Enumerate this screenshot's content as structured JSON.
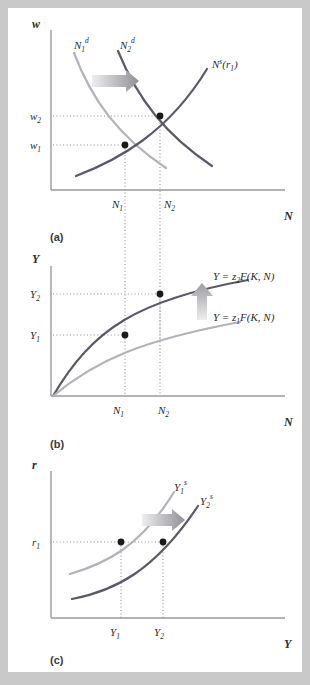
{
  "figure": {
    "background_color": "#c9c9c9",
    "panel_color": "#ffffff",
    "curve_dark_color": "#5a5a66",
    "curve_light_color": "#b2b2b8",
    "axis_color": "#9a9a9a",
    "point_color": "#1a1a1a"
  },
  "panel_a": {
    "id": "(a)",
    "y_axis_label": "w",
    "x_axis_label": "N",
    "y_ticks": [
      "w",
      "w"
    ],
    "y_tick_labels": [
      {
        "base": "w",
        "sub": "2"
      },
      {
        "base": "w",
        "sub": "1"
      }
    ],
    "x_tick_labels": [
      {
        "base": "N",
        "sub": "1"
      },
      {
        "base": "N",
        "sub": "2"
      }
    ],
    "curves": [
      {
        "name": "labor-demand-1",
        "base": "N",
        "sub": "1",
        "sup": "d",
        "color": "#b2b2b8",
        "shape": "downward"
      },
      {
        "name": "labor-demand-2",
        "base": "N",
        "sub": "2",
        "sup": "d",
        "color": "#5a5a66",
        "shape": "downward"
      },
      {
        "name": "labor-supply",
        "base": "N",
        "sup": "s",
        "suffix": "(r",
        "suffix_sub": "1",
        "suffix_end": ")",
        "color": "#5a5a66",
        "shape": "upward"
      }
    ],
    "arrow": {
      "name": "shift-right-arrow",
      "direction": "right"
    },
    "points": [
      {
        "name": "equilibrium-1",
        "x_label": "N1",
        "y_label": "w1"
      },
      {
        "name": "equilibrium-2",
        "x_label": "N2",
        "y_label": "w2"
      }
    ]
  },
  "panel_b": {
    "id": "(b)",
    "y_axis_label": "Y",
    "x_axis_label": "N",
    "y_tick_labels": [
      {
        "base": "Y",
        "sub": "2"
      },
      {
        "base": "Y",
        "sub": "1"
      }
    ],
    "x_tick_labels": [
      {
        "base": "N",
        "sub": "1"
      },
      {
        "base": "N",
        "sub": "2"
      }
    ],
    "curves": [
      {
        "name": "production-function-z2",
        "text_pre": "Y = z",
        "sub": "2",
        "text_post": "F(K, N)",
        "color": "#5a5a66"
      },
      {
        "name": "production-function-z1",
        "text_pre": "Y = z",
        "sub": "1",
        "text_post": "F(K, N)",
        "color": "#b2b2b8"
      }
    ],
    "arrow": {
      "name": "shift-up-arrow",
      "direction": "up"
    },
    "points": [
      {
        "name": "output-point-1",
        "x_label": "N1",
        "y_label": "Y1"
      },
      {
        "name": "output-point-2",
        "x_label": "N2",
        "y_label": "Y2"
      }
    ]
  },
  "panel_c": {
    "id": "(c)",
    "y_axis_label": "r",
    "x_axis_label": "Y",
    "y_tick_labels": [
      {
        "base": "r",
        "sub": "1"
      }
    ],
    "x_tick_labels": [
      {
        "base": "Y",
        "sub": "1"
      },
      {
        "base": "Y",
        "sub": "2"
      }
    ],
    "curves": [
      {
        "name": "output-supply-1",
        "base": "Y",
        "sub": "1",
        "sup": "s",
        "color": "#b2b2b8"
      },
      {
        "name": "output-supply-2",
        "base": "Y",
        "sub": "2",
        "sup": "s",
        "color": "#5a5a66"
      }
    ],
    "arrow": {
      "name": "shift-right-arrow",
      "direction": "right"
    },
    "points": [
      {
        "name": "supply-point-1",
        "x_label": "Y1",
        "y_label": "r1"
      },
      {
        "name": "supply-point-2",
        "x_label": "Y2",
        "y_label": "r1"
      }
    ]
  }
}
